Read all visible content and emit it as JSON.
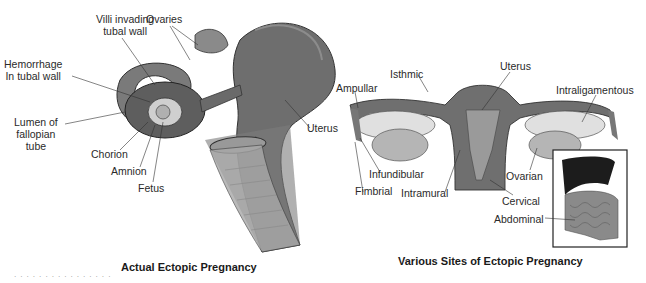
{
  "left_figure": {
    "title": "Actual Ectopic Pregnancy",
    "labels": {
      "villi": "Villi invading\ntubal wall",
      "villi_l1": "Villi invading",
      "villi_l2": "tubal wall",
      "ovaries": "Ovaries",
      "hemorrhage_l1": "Hemorrhage",
      "hemorrhage_l2": "In tubal wall",
      "lumen_l1": "Lumen of",
      "lumen_l2": "fallopian",
      "lumen_l3": "tube",
      "chorion": "Chorion",
      "amnion": "Amnion",
      "fetus": "Fetus",
      "uterus": "Uterus"
    }
  },
  "right_figure": {
    "title": "Various Sites of Ectopic Pregnancy",
    "labels": {
      "isthmic": "Isthmic",
      "ampullar": "Ampullar",
      "uterus": "Uterus",
      "intraligamentous": "Intraligamentous",
      "infundibular": "Infundibular",
      "fimbrial": "Fimbrial",
      "intramural": "Intramural",
      "ovarian": "Ovarian",
      "cervical": "Cervical",
      "abdominal": "Abdominal"
    }
  },
  "colors": {
    "tissue_dark": "#5a5a5a",
    "tissue_mid": "#8a8a8a",
    "tissue_light": "#c8c8c8",
    "liver": "#1c1c1c",
    "line": "#333333"
  }
}
